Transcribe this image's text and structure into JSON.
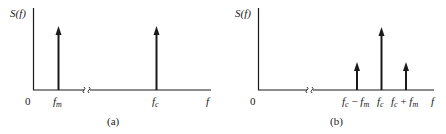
{
  "panels": [
    {
      "id": "a",
      "caption": "(a)",
      "y_label": "S(f)",
      "origin_label": "0",
      "x_axis_end_label": "f",
      "spectral_lines": [
        {
          "label_base": "f",
          "label_sub": "m",
          "relative_height": 1.0
        },
        {
          "label_base": "f",
          "label_sub": "c",
          "relative_height": 1.0
        }
      ]
    },
    {
      "id": "b",
      "caption": "(b)",
      "y_label": "S(f)",
      "origin_label": "0",
      "x_axis_end_label": "f",
      "spectral_lines": [
        {
          "label": "fc − fm",
          "label_parts": [
            "f",
            "c",
            " − ",
            "f",
            "m"
          ],
          "relative_height": 0.45
        },
        {
          "label": "fc",
          "label_parts": [
            "f",
            "c"
          ],
          "relative_height": 1.0
        },
        {
          "label": "fc + fm",
          "label_parts": [
            "f",
            "c",
            " + ",
            "f",
            "m"
          ],
          "relative_height": 0.45
        }
      ]
    }
  ],
  "labels": {
    "a_ylabel": "S(f)",
    "a_zero": "0",
    "a_fm_base": "f",
    "a_fm_sub": "m",
    "a_fc_base": "f",
    "a_fc_sub": "c",
    "a_f": "f",
    "a_caption": "(a)",
    "b_ylabel": "S(f)",
    "b_zero": "0",
    "b_l1_f1": "f",
    "b_l1_s1": "c",
    "b_l1_op": " − ",
    "b_l1_f2": "f",
    "b_l1_s2": "m",
    "b_l2_f": "f",
    "b_l2_s": "c",
    "b_l3_f1": "f",
    "b_l3_s1": "c",
    "b_l3_op": " + ",
    "b_l3_f2": "f",
    "b_l3_s2": "m",
    "b_f": "f",
    "b_caption": "(b)"
  }
}
